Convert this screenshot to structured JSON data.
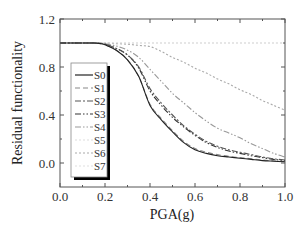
{
  "chart_data": {
    "type": "line",
    "title": "",
    "xlabel": "PGA(g)",
    "ylabel": "Residual functionality",
    "xlim": [
      0.0,
      1.0
    ],
    "ylim": [
      -0.2,
      1.2
    ],
    "xticks": [
      0.0,
      0.2,
      0.4,
      0.6,
      0.8,
      1.0
    ],
    "xtick_labels": [
      "0.0",
      "0.2",
      "0.4",
      "0.6",
      "0.8",
      "1.0"
    ],
    "xminor_step": 0.1,
    "yticks": [
      0.0,
      0.4,
      0.8,
      1.2
    ],
    "ytick_labels": [
      "0.0",
      "0.4",
      "0.8",
      "1.2"
    ],
    "yminor_step": 0.2,
    "grid": false,
    "legend": {
      "position": "left-center",
      "shadow": true
    },
    "x": [
      0.0,
      0.1,
      0.15,
      0.18,
      0.2,
      0.25,
      0.3,
      0.35,
      0.4,
      0.45,
      0.5,
      0.55,
      0.6,
      0.65,
      0.7,
      0.75,
      0.8,
      0.85,
      0.9,
      0.95,
      1.0
    ],
    "series": [
      {
        "name": "S0",
        "color": "#222222",
        "dash": "solid",
        "values": [
          1.0,
          1.0,
          1.0,
          0.995,
          0.985,
          0.94,
          0.86,
          0.72,
          0.48,
          0.36,
          0.26,
          0.17,
          0.11,
          0.08,
          0.06,
          0.05,
          0.04,
          0.03,
          0.02,
          0.015,
          0.01
        ]
      },
      {
        "name": "S1",
        "color": "#888888",
        "dash": "dashed",
        "values": [
          1.0,
          1.0,
          1.0,
          0.995,
          0.985,
          0.94,
          0.86,
          0.72,
          0.49,
          0.37,
          0.27,
          0.18,
          0.12,
          0.09,
          0.07,
          0.055,
          0.045,
          0.035,
          0.025,
          0.018,
          0.012
        ]
      },
      {
        "name": "S2",
        "color": "#555555",
        "dash": "dash-dot",
        "values": [
          1.0,
          1.0,
          1.0,
          0.997,
          0.99,
          0.955,
          0.9,
          0.8,
          0.62,
          0.5,
          0.4,
          0.31,
          0.24,
          0.18,
          0.14,
          0.11,
          0.09,
          0.07,
          0.05,
          0.035,
          0.025
        ]
      },
      {
        "name": "S3",
        "color": "#333333",
        "dash": "dash-dot-dot",
        "values": [
          1.0,
          1.0,
          1.0,
          0.997,
          0.99,
          0.955,
          0.9,
          0.79,
          0.6,
          0.48,
          0.38,
          0.3,
          0.23,
          0.17,
          0.13,
          0.1,
          0.08,
          0.06,
          0.045,
          0.03,
          0.02
        ]
      },
      {
        "name": "S4",
        "color": "#999999",
        "dash": "dash-dot-dot",
        "values": [
          1.0,
          1.0,
          1.0,
          0.998,
          0.995,
          0.975,
          0.94,
          0.88,
          0.78,
          0.68,
          0.58,
          0.5,
          0.42,
          0.35,
          0.29,
          0.25,
          0.21,
          0.16,
          0.12,
          0.08,
          0.05
        ]
      },
      {
        "name": "S5",
        "color": "#dddddd",
        "dash": "dotted",
        "values": [
          1.0,
          1.0,
          1.0,
          1.0,
          1.0,
          1.0,
          1.0,
          1.0,
          1.0,
          1.0,
          1.0,
          1.0,
          1.0,
          1.0,
          1.0,
          1.0,
          1.0,
          1.0,
          1.0,
          1.0,
          1.0
        ]
      },
      {
        "name": "S6",
        "color": "#aaaaaa",
        "dash": "dotted",
        "values": [
          1.0,
          1.0,
          1.0,
          1.0,
          1.0,
          0.995,
          0.99,
          0.98,
          0.97,
          0.93,
          0.88,
          0.84,
          0.79,
          0.75,
          0.7,
          0.66,
          0.61,
          0.57,
          0.52,
          0.48,
          0.44
        ]
      },
      {
        "name": "S7",
        "color": "#e0e0e0",
        "dash": "dotted",
        "values": [
          1.0,
          1.0,
          1.0,
          1.0,
          1.0,
          1.0,
          1.0,
          1.0,
          1.0,
          1.0,
          1.0,
          1.0,
          1.0,
          1.0,
          1.0,
          1.0,
          1.0,
          1.0,
          1.0,
          1.0,
          1.0
        ]
      }
    ]
  }
}
